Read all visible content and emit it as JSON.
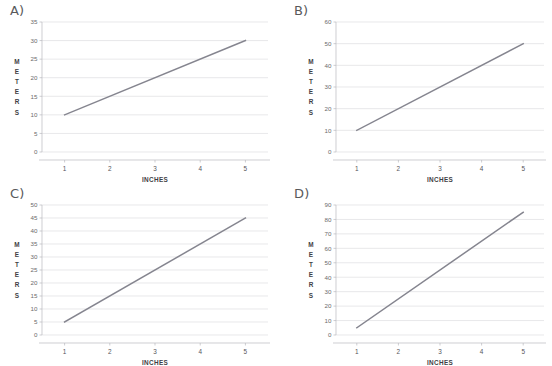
{
  "figure": {
    "panels": [
      {
        "id": "A",
        "label": "A)",
        "xlabel": "INCHES",
        "ylabel": "METERS",
        "ylabel_letters": [
          "M",
          "E",
          "T",
          "E",
          "R",
          "S"
        ],
        "yticks": [
          "0",
          "5",
          "10",
          "15",
          "20",
          "25",
          "30",
          "35"
        ],
        "xticks": [
          "1",
          "2",
          "3",
          "4",
          "5"
        ]
      },
      {
        "id": "B",
        "label": "B)",
        "xlabel": "INCHES",
        "ylabel": "METERS",
        "ylabel_letters": [
          "M",
          "E",
          "T",
          "E",
          "R",
          "S"
        ],
        "yticks": [
          "0",
          "10",
          "20",
          "30",
          "40",
          "50",
          "60"
        ],
        "xticks": [
          "1",
          "2",
          "3",
          "4",
          "5"
        ]
      },
      {
        "id": "C",
        "label": "C)",
        "xlabel": "INCHES",
        "ylabel": "METERS",
        "ylabel_letters": [
          "M",
          "E",
          "T",
          "E",
          "R",
          "S"
        ],
        "yticks": [
          "0",
          "5",
          "10",
          "15",
          "20",
          "25",
          "30",
          "35",
          "40",
          "45",
          "50"
        ],
        "xticks": [
          "1",
          "2",
          "3",
          "4",
          "5"
        ]
      },
      {
        "id": "D",
        "label": "D)",
        "xlabel": "INCHES",
        "ylabel": "METERS",
        "ylabel_letters": [
          "M",
          "E",
          "T",
          "E",
          "R",
          "S"
        ],
        "yticks": [
          "0",
          "10",
          "20",
          "30",
          "40",
          "50",
          "60",
          "70",
          "80",
          "90"
        ],
        "xticks": [
          "1",
          "2",
          "3",
          "4",
          "5"
        ]
      }
    ],
    "colors": {
      "line": "#85858f",
      "gridline": "#d8d8dc",
      "axis": "#b9b9be",
      "text": "#3f3f45",
      "background": "#ffffff"
    }
  },
  "chart_data": [
    {
      "type": "line",
      "title": "A)",
      "xlabel": "INCHES",
      "ylabel": "METERS",
      "x": [
        1,
        5
      ],
      "values": [
        10,
        30
      ],
      "xlim": [
        0.5,
        5.5
      ],
      "ylim": [
        0,
        35
      ],
      "ytick_values": [
        0,
        5,
        10,
        15,
        20,
        25,
        30,
        35
      ],
      "xtick_values": [
        1,
        2,
        3,
        4,
        5
      ],
      "grid": true,
      "legend": false,
      "slope": 5,
      "intercept": 5
    },
    {
      "type": "line",
      "title": "B)",
      "xlabel": "INCHES",
      "ylabel": "METERS",
      "x": [
        1,
        5
      ],
      "values": [
        10,
        50
      ],
      "xlim": [
        0.5,
        5.5
      ],
      "ylim": [
        0,
        60
      ],
      "ytick_values": [
        0,
        10,
        20,
        30,
        40,
        50,
        60
      ],
      "xtick_values": [
        1,
        2,
        3,
        4,
        5
      ],
      "grid": true,
      "legend": false,
      "slope": 10,
      "intercept": 0
    },
    {
      "type": "line",
      "title": "C)",
      "xlabel": "INCHES",
      "ylabel": "METERS",
      "x": [
        1,
        5
      ],
      "values": [
        5,
        45
      ],
      "xlim": [
        0.5,
        5.5
      ],
      "ylim": [
        0,
        50
      ],
      "ytick_values": [
        0,
        5,
        10,
        15,
        20,
        25,
        30,
        35,
        40,
        45,
        50
      ],
      "xtick_values": [
        1,
        2,
        3,
        4,
        5
      ],
      "grid": true,
      "legend": false,
      "slope": 10,
      "intercept": -5
    },
    {
      "type": "line",
      "title": "D)",
      "xlabel": "INCHES",
      "ylabel": "METERS",
      "x": [
        1,
        5
      ],
      "values": [
        5,
        85
      ],
      "xlim": [
        0.5,
        5.5
      ],
      "ylim": [
        0,
        90
      ],
      "ytick_values": [
        0,
        10,
        20,
        30,
        40,
        50,
        60,
        70,
        80,
        90
      ],
      "xtick_values": [
        1,
        2,
        3,
        4,
        5
      ],
      "grid": true,
      "legend": false,
      "slope": 20,
      "intercept": -15
    }
  ]
}
